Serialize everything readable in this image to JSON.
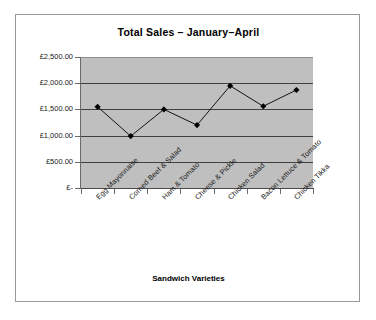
{
  "chart_data": {
    "type": "line",
    "title": "Total Sales – January–April",
    "xlabel": "Sandwich Varieties",
    "ylabel": "",
    "categories": [
      "Egg Mayonnaise",
      "Corned Beef & Salad",
      "Ham & Tomato",
      "Cheese & Pickle",
      "Chicken Salad",
      "Bacon Lettuce & Tomato",
      "Chicken Tikka"
    ],
    "values": [
      1550,
      990,
      1500,
      1200,
      1950,
      1560,
      1870
    ],
    "ylim": [
      0,
      2500
    ],
    "yticks": [
      0,
      500,
      1000,
      1500,
      2000,
      2500
    ],
    "ytick_labels": [
      "£-",
      "£500.00",
      "£1,000.00",
      "£1,500.00",
      "£2,000.00",
      "£2,500.00"
    ],
    "grid": true,
    "legend": false,
    "marker": "diamond",
    "series_color": "#000000",
    "plot_background": "#bfbfbf",
    "chart_background": "#ffffff",
    "gridline_color": "#404040"
  },
  "frame": {
    "border_color": "#9a9a9a"
  }
}
